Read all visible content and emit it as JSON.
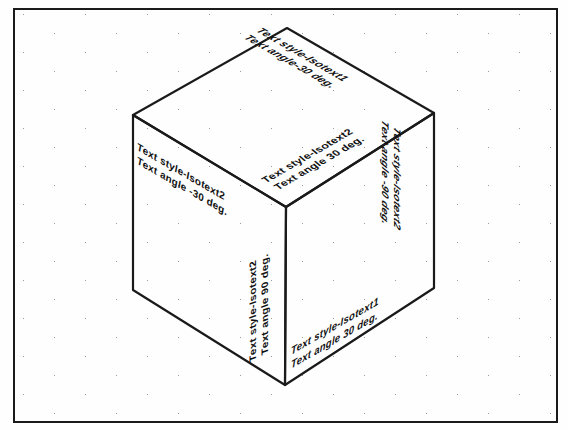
{
  "drawing": {
    "title": "Isometric Text Styles Demonstration",
    "background_color": "#fefefe",
    "line_color": "#1a1a1a",
    "grid_dot_color": "#9a9a9a",
    "frame": {
      "x": 13,
      "y": 8,
      "width": 545,
      "height": 415,
      "border_width": 2
    },
    "grid": {
      "type": "isometric-dot-grid",
      "dot_spacing_x": 62,
      "dot_row_offset_y": 19,
      "row_stagger_x": 31
    },
    "cube": {
      "type": "isometric-cube",
      "vertices": {
        "top_apex": [
          287,
          28
        ],
        "left": [
          133,
          115
        ],
        "right": [
          434,
          113
        ],
        "center": [
          286,
          207
        ],
        "bottom_left": [
          133,
          290
        ],
        "bottom_right": [
          434,
          288
        ],
        "bottom_apex": [
          285,
          385
        ]
      },
      "faces": [
        "top",
        "left",
        "right"
      ]
    },
    "labels": [
      {
        "id": "top-right",
        "face": "top",
        "style_line": "Text style-Isotext1",
        "angle_line": "Text angle-30 deg.",
        "angle_deg": -30
      },
      {
        "id": "top-front",
        "face": "top",
        "style_line": "Text style-Isotext2",
        "angle_line": "Text angle 30 deg.",
        "angle_deg": 30
      },
      {
        "id": "left-top",
        "face": "left",
        "style_line": "Text style-Isotext2",
        "angle_line": "Text angle -30 deg.",
        "angle_deg": -30
      },
      {
        "id": "left-vert",
        "face": "left",
        "style_line": "Text style-Isotext2",
        "angle_line": "Text angle 90 deg.",
        "angle_deg": 90
      },
      {
        "id": "right-top",
        "face": "right",
        "style_line": "Text style-Isotext1",
        "angle_line": "Text angle 30 deg.",
        "angle_deg": 30
      },
      {
        "id": "right-vert",
        "face": "right",
        "style_line": "Text style-Isotext2",
        "angle_line": "Text angle -90 deg.",
        "angle_deg": -90
      }
    ]
  }
}
